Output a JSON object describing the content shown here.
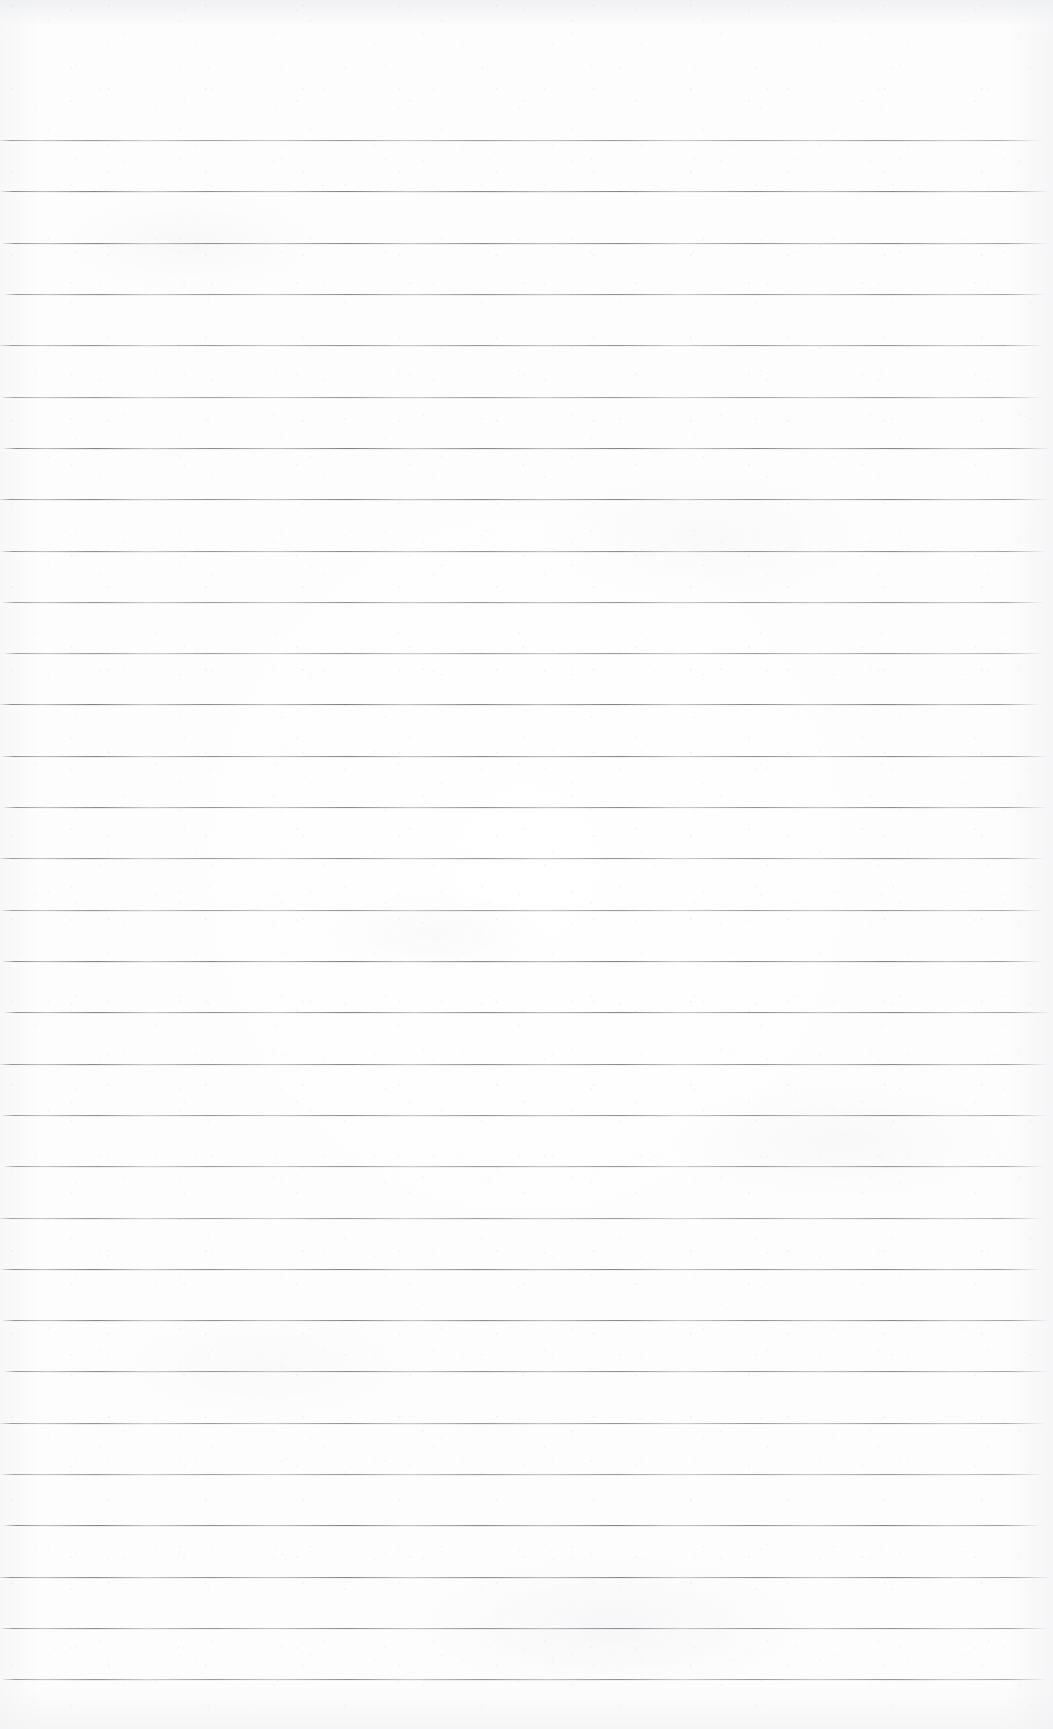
{
  "document": {
    "type": "scanned-ruled-paper",
    "title": "Blank lined notebook page",
    "content_text": "",
    "handwriting_present": "no",
    "printed_text_present": "no",
    "page_width": 1053,
    "page_height": 1729
  },
  "paper": {
    "background_color": "#fdfdfd",
    "edge_shadow_color": "#eeeff1",
    "texture": "scanner grain and faint mottling",
    "orientation": "portrait"
  },
  "ruling": {
    "style": "horizontal single ruled lines",
    "line_color": "#7a7a84",
    "line_thickness_px": 1,
    "line_count": 31,
    "first_line_y": 140,
    "line_spacing_px": 51.3,
    "line_start_x": 2,
    "line_end_x": 1046,
    "top_margin_px": 140,
    "bottom_margin_px": 51,
    "margin_rule_present": "no",
    "line_y_positions": [
      140,
      191,
      243,
      294,
      345,
      397,
      448,
      499,
      551,
      602,
      653,
      704,
      756,
      807,
      858,
      910,
      961,
      1012,
      1064,
      1115,
      1166,
      1218,
      1269,
      1320,
      1371,
      1423,
      1474,
      1525,
      1577,
      1628,
      1679
    ]
  }
}
